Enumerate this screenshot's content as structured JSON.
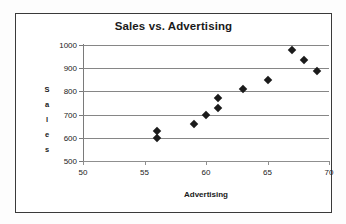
{
  "chart_data": {
    "type": "scatter",
    "title": "Sales vs. Advertising",
    "xlabel": "Advertising",
    "ylabel": "Sales",
    "xlim": [
      50,
      70
    ],
    "ylim": [
      500,
      1000
    ],
    "xticks": [
      50,
      55,
      60,
      65,
      70
    ],
    "yticks": [
      500,
      600,
      700,
      800,
      900,
      1000
    ],
    "xtick_labels": [
      "50",
      "55",
      "60",
      "65",
      "70"
    ],
    "ytick_labels": [
      "500",
      "600",
      "700",
      "800",
      "900",
      "1000"
    ],
    "grid": "horizontal",
    "legend": null,
    "marker": "diamond",
    "marker_color": "#1b1b1b",
    "series": [
      {
        "name": "Sales",
        "points": [
          {
            "x": 56,
            "y": 600
          },
          {
            "x": 56,
            "y": 630
          },
          {
            "x": 59,
            "y": 660
          },
          {
            "x": 60,
            "y": 700
          },
          {
            "x": 61,
            "y": 730
          },
          {
            "x": 61,
            "y": 770
          },
          {
            "x": 63,
            "y": 810
          },
          {
            "x": 65,
            "y": 850
          },
          {
            "x": 67,
            "y": 980
          },
          {
            "x": 68,
            "y": 935
          },
          {
            "x": 69,
            "y": 890
          }
        ]
      }
    ]
  },
  "ylabel_chars": [
    "S",
    "a",
    "l",
    "e",
    "s"
  ],
  "colors": {
    "frame_border": "#3a3a3a",
    "gridline": "#868686",
    "axis": "#7a7a7a",
    "text": "#1a1a1a",
    "background": "#ffffff"
  }
}
